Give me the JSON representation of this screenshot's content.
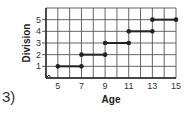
{
  "problem_label": "3)",
  "chart_data": {
    "type": "line",
    "subtype": "step",
    "title": "",
    "xlabel": "Age",
    "ylabel": "Division",
    "xlim": [
      4,
      15
    ],
    "ylim": [
      0,
      6
    ],
    "x_ticks": [
      5,
      7,
      9,
      11,
      13,
      15
    ],
    "y_ticks": [
      1,
      2,
      3,
      4,
      5
    ],
    "grid": true,
    "axis_break": true,
    "segments": [
      {
        "x": [
          5,
          7
        ],
        "y": 1
      },
      {
        "x": [
          7,
          9
        ],
        "y": 2
      },
      {
        "x": [
          9,
          11
        ],
        "y": 3
      },
      {
        "x": [
          11,
          13
        ],
        "y": 4
      },
      {
        "x": [
          13,
          15
        ],
        "y": 5
      }
    ],
    "endpoints": "closed",
    "colors": {
      "line": "#222222",
      "grid": "#555555"
    }
  }
}
